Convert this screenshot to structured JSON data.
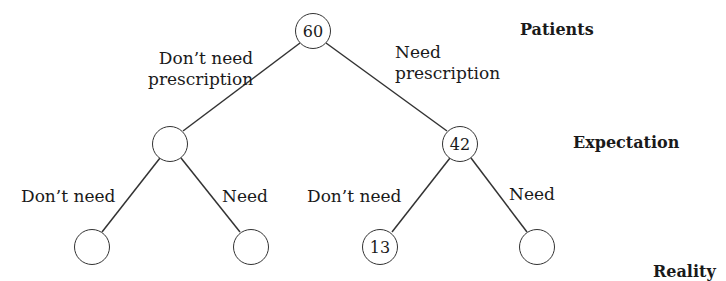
{
  "diagram": {
    "type": "probability-tree",
    "levels": {
      "root": "Patients",
      "middle": "Expectation",
      "leaves": "Reality"
    },
    "nodes": {
      "root": {
        "value": "60"
      },
      "mid_left": {
        "value": ""
      },
      "mid_right": {
        "value": "42"
      },
      "leaf_ll": {
        "value": ""
      },
      "leaf_lr": {
        "value": ""
      },
      "leaf_rl": {
        "value": "13"
      },
      "leaf_rr": {
        "value": ""
      }
    },
    "edges": {
      "root_left": {
        "line1": "Don’t need",
        "line2": "prescription"
      },
      "root_right": {
        "line1": "Need",
        "line2": "prescription"
      },
      "mid_left_left": "Don’t need",
      "mid_left_right": "Need",
      "mid_right_left": "Don’t need",
      "mid_right_right": "Need"
    }
  }
}
